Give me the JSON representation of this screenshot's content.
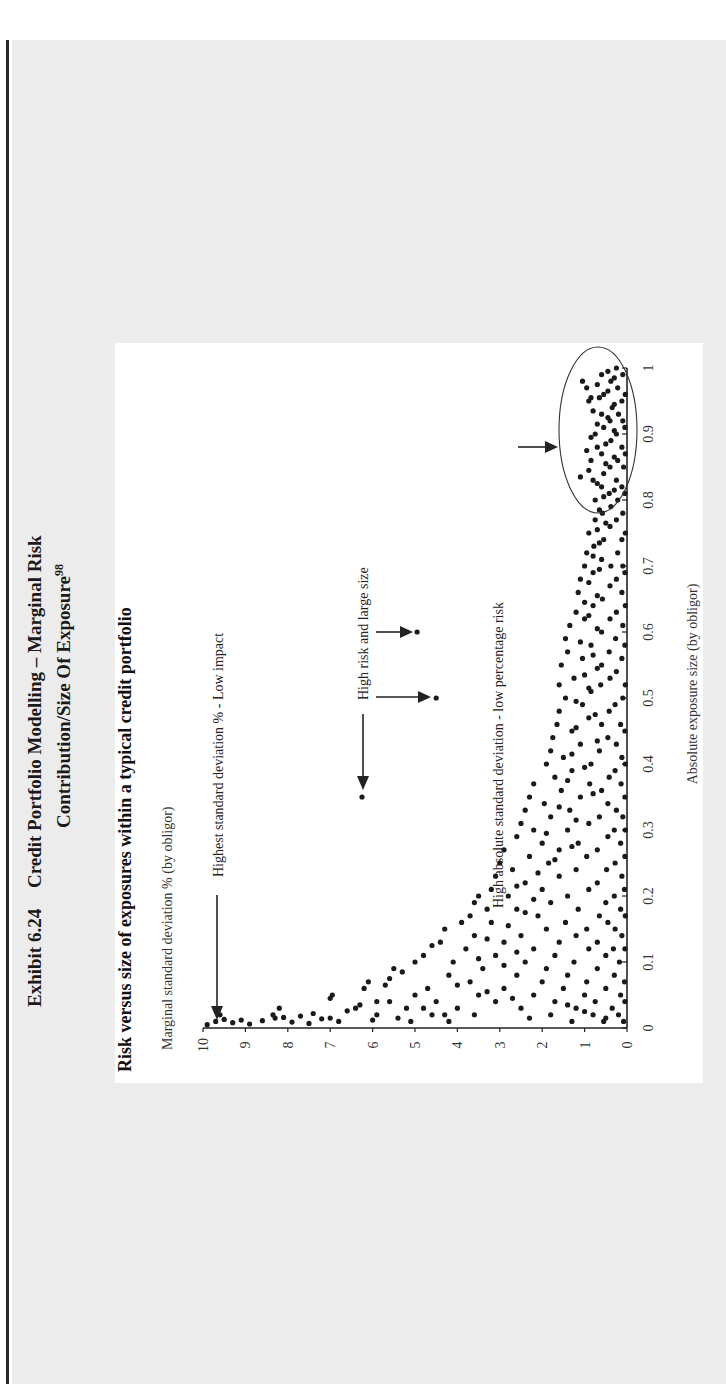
{
  "exhibit": {
    "number": "Exhibit 6.24",
    "title_line1": "Credit Portfolio Modelling – Marginal Risk",
    "title_line2": "Contribution/Size Of Exposure",
    "footnote_ref": "98"
  },
  "colors": {
    "page_background": "#ececec",
    "panel_background": "#ffffff",
    "points": "#1a1a1a",
    "edge_line": "#2a2a2a"
  },
  "chart_data": {
    "type": "scatter",
    "title": "Risk versus size of exposures within a typical credit portfolio",
    "xlabel": "Absolute exposure size (by obligor)",
    "ylabel": "Marginal standard deviation % (by obligor)",
    "xlim": [
      0,
      1
    ],
    "ylim": [
      0,
      10
    ],
    "xticks": [
      "0",
      "0.1",
      "0.2",
      "0.3",
      "0.4",
      "0.5",
      "0.6",
      "0.7",
      "0.8",
      "0.9",
      "1"
    ],
    "yticks": [
      "0",
      "1",
      "2",
      "3",
      "4",
      "5",
      "6",
      "7",
      "8",
      "9",
      "10"
    ],
    "grid": false,
    "legend": null,
    "annotations": [
      {
        "id": "highest-std",
        "text": "Highest standard deviation % - Low impact",
        "points_to": [
          0.01,
          9.6
        ]
      },
      {
        "id": "high-risk-large",
        "text": "High risk and large size",
        "points_to": [
          [
            0.35,
            6.25
          ],
          [
            0.5,
            4.5
          ],
          [
            0.6,
            4.95
          ]
        ]
      },
      {
        "id": "high-abs-std",
        "text": "High absolute standard deviation - low percentage risk",
        "region": "ellipse around x 0.79-1.0, y 0-1.5"
      }
    ],
    "highlighted_points": [
      [
        0.35,
        6.25
      ],
      [
        0.5,
        4.5
      ],
      [
        0.6,
        4.95
      ]
    ],
    "points": [
      [
        0.005,
        9.9
      ],
      [
        0.01,
        9.7
      ],
      [
        0.013,
        9.5
      ],
      [
        0.008,
        9.3
      ],
      [
        0.012,
        9.1
      ],
      [
        0.006,
        8.9
      ],
      [
        0.011,
        8.6
      ],
      [
        0.015,
        8.3
      ],
      [
        0.02,
        8.35
      ],
      [
        0.016,
        8.1
      ],
      [
        0.009,
        7.9
      ],
      [
        0.018,
        7.7
      ],
      [
        0.007,
        7.5
      ],
      [
        0.022,
        7.4
      ],
      [
        0.014,
        7.2
      ],
      [
        0.045,
        7.0
      ],
      [
        0.05,
        6.95
      ],
      [
        0.01,
        6.8
      ],
      [
        0.026,
        6.6
      ],
      [
        0.03,
        6.4
      ],
      [
        0.06,
        6.2
      ],
      [
        0.07,
        6.1
      ],
      [
        0.012,
        6.0
      ],
      [
        0.02,
        5.9
      ],
      [
        0.04,
        5.9
      ],
      [
        0.065,
        5.7
      ],
      [
        0.075,
        5.6
      ],
      [
        0.09,
        5.5
      ],
      [
        0.085,
        5.3
      ],
      [
        0.015,
        5.4
      ],
      [
        0.03,
        5.2
      ],
      [
        0.05,
        5.0
      ],
      [
        0.1,
        5.0
      ],
      [
        0.11,
        4.8
      ],
      [
        0.125,
        4.6
      ],
      [
        0.06,
        4.7
      ],
      [
        0.02,
        4.6
      ],
      [
        0.04,
        4.5
      ],
      [
        0.13,
        4.4
      ],
      [
        0.15,
        4.3
      ],
      [
        0.08,
        4.2
      ],
      [
        0.1,
        4.1
      ],
      [
        0.01,
        4.2
      ],
      [
        0.03,
        4.0
      ],
      [
        0.16,
        3.9
      ],
      [
        0.17,
        3.7
      ],
      [
        0.19,
        3.6
      ],
      [
        0.2,
        3.5
      ],
      [
        0.12,
        3.8
      ],
      [
        0.14,
        3.6
      ],
      [
        0.07,
        3.7
      ],
      [
        0.05,
        3.5
      ],
      [
        0.02,
        3.6
      ],
      [
        0.09,
        3.4
      ],
      [
        0.18,
        3.3
      ],
      [
        0.21,
        3.2
      ],
      [
        0.23,
        3.1
      ],
      [
        0.25,
        3.0
      ],
      [
        0.27,
        2.9
      ],
      [
        0.16,
        3.2
      ],
      [
        0.11,
        3.1
      ],
      [
        0.04,
        3.1
      ],
      [
        0.13,
        2.9
      ],
      [
        0.06,
        2.9
      ],
      [
        0.2,
        2.8
      ],
      [
        0.24,
        2.7
      ],
      [
        0.29,
        2.6
      ],
      [
        0.31,
        2.5
      ],
      [
        0.33,
        2.4
      ],
      [
        0.35,
        2.3
      ],
      [
        0.37,
        2.2
      ],
      [
        0.18,
        2.6
      ],
      [
        0.14,
        2.5
      ],
      [
        0.08,
        2.6
      ],
      [
        0.03,
        2.5
      ],
      [
        0.1,
        2.4
      ],
      [
        0.22,
        2.4
      ],
      [
        0.26,
        2.3
      ],
      [
        0.3,
        2.2
      ],
      [
        0.015,
        2.3
      ],
      [
        0.05,
        2.2
      ],
      [
        0.12,
        2.2
      ],
      [
        0.17,
        2.1
      ],
      [
        0.21,
        2.0
      ],
      [
        0.28,
        2.0
      ],
      [
        0.34,
        1.95
      ],
      [
        0.4,
        1.9
      ],
      [
        0.42,
        1.8
      ],
      [
        0.44,
        1.75
      ],
      [
        0.07,
        2.0
      ],
      [
        0.09,
        1.9
      ],
      [
        0.15,
        1.9
      ],
      [
        0.19,
        1.8
      ],
      [
        0.25,
        1.85
      ],
      [
        0.32,
        1.8
      ],
      [
        0.38,
        1.7
      ],
      [
        0.46,
        1.65
      ],
      [
        0.48,
        1.6
      ],
      [
        0.52,
        1.6
      ],
      [
        0.55,
        1.55
      ],
      [
        0.02,
        1.8
      ],
      [
        0.04,
        1.7
      ],
      [
        0.11,
        1.7
      ],
      [
        0.13,
        1.6
      ],
      [
        0.23,
        1.6
      ],
      [
        0.27,
        1.6
      ],
      [
        0.36,
        1.55
      ],
      [
        0.41,
        1.5
      ],
      [
        0.5,
        1.45
      ],
      [
        0.57,
        1.4
      ],
      [
        0.59,
        1.45
      ],
      [
        0.61,
        1.35
      ],
      [
        0.06,
        1.5
      ],
      [
        0.08,
        1.4
      ],
      [
        0.16,
        1.45
      ],
      [
        0.2,
        1.4
      ],
      [
        0.3,
        1.4
      ],
      [
        0.33,
        1.35
      ],
      [
        0.39,
        1.3
      ],
      [
        0.45,
        1.3
      ],
      [
        0.53,
        1.25
      ],
      [
        0.63,
        1.2
      ],
      [
        0.66,
        1.15
      ],
      [
        0.68,
        1.1
      ],
      [
        0.01,
        1.3
      ],
      [
        0.03,
        1.2
      ],
      [
        0.1,
        1.25
      ],
      [
        0.14,
        1.2
      ],
      [
        0.18,
        1.15
      ],
      [
        0.24,
        1.2
      ],
      [
        0.28,
        1.15
      ],
      [
        0.35,
        1.1
      ],
      [
        0.43,
        1.1
      ],
      [
        0.49,
        1.05
      ],
      [
        0.56,
        1.05
      ],
      [
        0.62,
        1.0
      ],
      [
        0.7,
        1.0
      ],
      [
        0.72,
        0.95
      ],
      [
        0.75,
        0.9
      ],
      [
        0.05,
        1.0
      ],
      [
        0.07,
        0.95
      ],
      [
        0.12,
        0.9
      ],
      [
        0.15,
        0.95
      ],
      [
        0.21,
        0.9
      ],
      [
        0.26,
        0.95
      ],
      [
        0.31,
        0.9
      ],
      [
        0.37,
        0.88
      ],
      [
        0.4,
        0.85
      ],
      [
        0.47,
        0.9
      ],
      [
        0.51,
        0.85
      ],
      [
        0.58,
        0.85
      ],
      [
        0.64,
        0.8
      ],
      [
        0.69,
        0.8
      ],
      [
        0.73,
        0.78
      ],
      [
        0.77,
        0.75
      ],
      [
        0.8,
        0.75
      ],
      [
        0.83,
        0.8
      ],
      [
        0.86,
        0.85
      ],
      [
        0.88,
        0.7
      ],
      [
        0.9,
        0.75
      ],
      [
        0.95,
        0.9
      ],
      [
        0.97,
        0.95
      ],
      [
        0.02,
        0.8
      ],
      [
        0.04,
        0.75
      ],
      [
        0.09,
        0.7
      ],
      [
        0.13,
        0.7
      ],
      [
        0.17,
        0.65
      ],
      [
        0.22,
        0.7
      ],
      [
        0.27,
        0.7
      ],
      [
        0.32,
        0.65
      ],
      [
        0.36,
        0.6
      ],
      [
        0.42,
        0.65
      ],
      [
        0.46,
        0.6
      ],
      [
        0.52,
        0.62
      ],
      [
        0.55,
        0.6
      ],
      [
        0.6,
        0.6
      ],
      [
        0.65,
        0.58
      ],
      [
        0.71,
        0.6
      ],
      [
        0.74,
        0.55
      ],
      [
        0.78,
        0.58
      ],
      [
        0.82,
        0.6
      ],
      [
        0.84,
        0.55
      ],
      [
        0.87,
        0.6
      ],
      [
        0.91,
        0.55
      ],
      [
        0.93,
        0.6
      ],
      [
        0.96,
        0.55
      ],
      [
        0.99,
        0.6
      ],
      [
        0.01,
        0.55
      ],
      [
        0.06,
        0.5
      ],
      [
        0.11,
        0.5
      ],
      [
        0.16,
        0.45
      ],
      [
        0.19,
        0.5
      ],
      [
        0.24,
        0.48
      ],
      [
        0.29,
        0.45
      ],
      [
        0.34,
        0.45
      ],
      [
        0.38,
        0.42
      ],
      [
        0.44,
        0.45
      ],
      [
        0.48,
        0.42
      ],
      [
        0.53,
        0.4
      ],
      [
        0.57,
        0.42
      ],
      [
        0.62,
        0.4
      ],
      [
        0.67,
        0.4
      ],
      [
        0.7,
        0.38
      ],
      [
        0.76,
        0.4
      ],
      [
        0.79,
        0.38
      ],
      [
        0.81,
        0.42
      ],
      [
        0.85,
        0.4
      ],
      [
        0.89,
        0.38
      ],
      [
        0.92,
        0.4
      ],
      [
        0.94,
        0.35
      ],
      [
        0.98,
        0.38
      ],
      [
        0.03,
        0.35
      ],
      [
        0.08,
        0.3
      ],
      [
        0.12,
        0.32
      ],
      [
        0.15,
        0.28
      ],
      [
        0.2,
        0.3
      ],
      [
        0.25,
        0.28
      ],
      [
        0.3,
        0.3
      ],
      [
        0.33,
        0.25
      ],
      [
        0.39,
        0.28
      ],
      [
        0.43,
        0.25
      ],
      [
        0.49,
        0.28
      ],
      [
        0.54,
        0.25
      ],
      [
        0.59,
        0.27
      ],
      [
        0.63,
        0.25
      ],
      [
        0.68,
        0.25
      ],
      [
        0.72,
        0.22
      ],
      [
        0.77,
        0.25
      ],
      [
        0.8,
        0.22
      ],
      [
        0.83,
        0.25
      ],
      [
        0.86,
        0.22
      ],
      [
        0.9,
        0.25
      ],
      [
        0.93,
        0.2
      ],
      [
        0.97,
        0.22
      ],
      [
        1.0,
        0.25
      ],
      [
        0.02,
        0.2
      ],
      [
        0.05,
        0.15
      ],
      [
        0.1,
        0.18
      ],
      [
        0.14,
        0.12
      ],
      [
        0.18,
        0.15
      ],
      [
        0.23,
        0.12
      ],
      [
        0.28,
        0.15
      ],
      [
        0.32,
        0.1
      ],
      [
        0.37,
        0.14
      ],
      [
        0.41,
        0.12
      ],
      [
        0.46,
        0.15
      ],
      [
        0.5,
        0.1
      ],
      [
        0.56,
        0.12
      ],
      [
        0.61,
        0.1
      ],
      [
        0.66,
        0.12
      ],
      [
        0.7,
        0.1
      ],
      [
        0.74,
        0.12
      ],
      [
        0.78,
        0.1
      ],
      [
        0.82,
        0.12
      ],
      [
        0.85,
        0.08
      ],
      [
        0.88,
        0.12
      ],
      [
        0.92,
        0.1
      ],
      [
        0.95,
        0.12
      ],
      [
        0.99,
        0.1
      ],
      [
        0.01,
        0.08
      ],
      [
        0.04,
        0.05
      ],
      [
        0.07,
        0.06
      ],
      [
        0.12,
        0.05
      ],
      [
        0.17,
        0.04
      ],
      [
        0.21,
        0.06
      ],
      [
        0.26,
        0.05
      ],
      [
        0.3,
        0.04
      ],
      [
        0.35,
        0.05
      ],
      [
        0.4,
        0.04
      ],
      [
        0.45,
        0.05
      ],
      [
        0.52,
        0.04
      ],
      [
        0.58,
        0.05
      ],
      [
        0.64,
        0.04
      ],
      [
        0.69,
        0.05
      ],
      [
        0.75,
        0.04
      ],
      [
        0.81,
        0.05
      ],
      [
        0.87,
        0.04
      ],
      [
        0.91,
        0.05
      ],
      [
        0.96,
        0.04
      ],
      [
        0.015,
        0.5
      ],
      [
        0.025,
        1.0
      ],
      [
        0.035,
        1.4
      ],
      [
        0.045,
        2.7
      ],
      [
        0.055,
        3.3
      ],
      [
        0.065,
        4.0
      ],
      [
        0.02,
        4.3
      ],
      [
        0.03,
        4.8
      ],
      [
        0.01,
        5.1
      ],
      [
        0.04,
        5.6
      ],
      [
        0.035,
        6.3
      ],
      [
        0.015,
        7.0
      ],
      [
        0.03,
        8.2
      ],
      [
        0.02,
        9.6
      ],
      [
        0.095,
        2.9
      ],
      [
        0.105,
        3.5
      ],
      [
        0.115,
        2.6
      ],
      [
        0.135,
        3.3
      ],
      [
        0.155,
        2.8
      ],
      [
        0.175,
        2.4
      ],
      [
        0.195,
        2.2
      ],
      [
        0.215,
        2.6
      ],
      [
        0.235,
        2.1
      ],
      [
        0.255,
        1.7
      ],
      [
        0.275,
        1.3
      ],
      [
        0.295,
        1.9
      ],
      [
        0.315,
        1.2
      ],
      [
        0.335,
        1.6
      ],
      [
        0.355,
        0.8
      ],
      [
        0.375,
        1.4
      ],
      [
        0.395,
        1.0
      ],
      [
        0.415,
        1.3
      ],
      [
        0.435,
        0.7
      ],
      [
        0.455,
        1.2
      ],
      [
        0.475,
        0.75
      ],
      [
        0.495,
        1.2
      ],
      [
        0.515,
        0.9
      ],
      [
        0.535,
        1.0
      ],
      [
        0.545,
        0.7
      ],
      [
        0.565,
        0.8
      ],
      [
        0.585,
        1.1
      ],
      [
        0.605,
        0.7
      ],
      [
        0.625,
        0.9
      ],
      [
        0.645,
        1.0
      ],
      [
        0.655,
        0.7
      ],
      [
        0.675,
        0.9
      ],
      [
        0.695,
        0.65
      ],
      [
        0.715,
        0.8
      ],
      [
        0.735,
        0.65
      ],
      [
        0.755,
        0.7
      ],
      [
        0.765,
        0.5
      ],
      [
        0.785,
        0.65
      ],
      [
        0.805,
        0.55
      ],
      [
        0.815,
        0.3
      ],
      [
        0.825,
        0.7
      ],
      [
        0.835,
        1.1
      ],
      [
        0.845,
        0.9
      ],
      [
        0.855,
        0.5
      ],
      [
        0.865,
        0.3
      ],
      [
        0.875,
        0.95
      ],
      [
        0.885,
        0.5
      ],
      [
        0.895,
        0.85
      ],
      [
        0.905,
        0.3
      ],
      [
        0.915,
        0.7
      ],
      [
        0.925,
        0.45
      ],
      [
        0.935,
        0.8
      ],
      [
        0.945,
        0.3
      ],
      [
        0.955,
        0.65
      ],
      [
        0.965,
        0.45
      ],
      [
        0.975,
        0.7
      ],
      [
        0.985,
        0.3
      ],
      [
        0.995,
        0.45
      ],
      [
        0.98,
        1.05
      ],
      [
        0.955,
        0.85
      ]
    ]
  }
}
